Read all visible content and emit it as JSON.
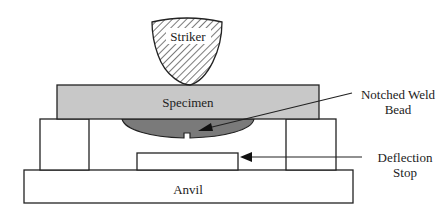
{
  "diagram": {
    "labels": {
      "striker": "Striker",
      "specimen": "Specimen",
      "anvil": "Anvil",
      "weld_line1": "Notched Weld",
      "weld_line2": "Bead",
      "stop_line1": "Deflection",
      "stop_line2": "Stop"
    },
    "colors": {
      "specimen_fill": "#c8c8c8",
      "weld_fill": "#7a7a7a",
      "stroke": "#222222",
      "hatch": "#333333",
      "background": "#ffffff"
    }
  }
}
